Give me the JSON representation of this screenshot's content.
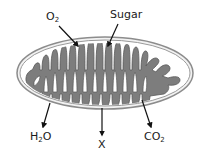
{
  "diagram": {
    "colors": {
      "outer_membrane": "#8c8c8c",
      "intermembrane_space": "#f2f2f2",
      "matrix_fill": "#7d7d7d",
      "matrix_outline": "#5a5a5a",
      "arrow": "#111111",
      "text": "#1a1a1a"
    },
    "labels": {
      "o2": {
        "base": "O",
        "sub": "2"
      },
      "sugar": {
        "text": "Sugar"
      },
      "h2o_pre": {
        "base": "H",
        "sub": "2",
        "post": "O"
      },
      "x": {
        "text": "X"
      },
      "co2": {
        "base": "CO",
        "sub": "2"
      }
    },
    "inputs": [
      "O2",
      "Sugar"
    ],
    "outputs": [
      "H2O",
      "X",
      "CO2"
    ]
  }
}
